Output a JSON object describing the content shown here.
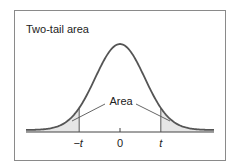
{
  "title": "Two-tail area",
  "annotation": "Area",
  "tick_labels": {
    "neg_t": "−t",
    "zero": "0",
    "pos_t": "t"
  },
  "colors": {
    "curve": "#555555",
    "axis": "#444444",
    "frame": "#8a8a8a",
    "tail_fill": "#e6e6e6",
    "text": "#222222"
  },
  "chart_data": {
    "type": "area",
    "title": "Two-tail area",
    "distribution": "t (standard bell curve)",
    "x_range": [
      -3.8,
      3.8
    ],
    "critical_value_t": 1.65,
    "shaded_regions": [
      "x < -t",
      "x > t"
    ],
    "annotation": "Area",
    "ticks": [
      {
        "value": -1.65,
        "label": "−t"
      },
      {
        "value": 0,
        "label": "0"
      },
      {
        "value": 1.65,
        "label": "t"
      }
    ],
    "xlabel": "",
    "ylabel": "",
    "grid": false
  }
}
